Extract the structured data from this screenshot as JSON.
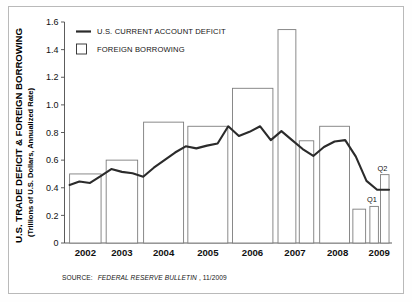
{
  "figure": {
    "border_color": "#b9b9b9",
    "background": "#ffffff"
  },
  "axis_title": {
    "main": "U.S. TRADE DEFICIT & FOREIGN BORROWING",
    "sub": "(Trillions of U.S. Dollars, Annualized Rate)"
  },
  "legend": {
    "position": "top-left-inside",
    "items": [
      {
        "label": "U.S. CURRENT ACCOUNT DEFICIT",
        "marker": "line",
        "color": "#2b2b2b"
      },
      {
        "label": "FOREIGN BORROWING",
        "marker": "open-square",
        "color": "#2b2b2b"
      }
    ]
  },
  "source": {
    "prefix": "SOURCE:",
    "publication": "FEDERAL RESERVE BULLETIN",
    "date": ", 11/2009"
  },
  "annotations": [
    {
      "text": "Q1",
      "x_value": 2008.875,
      "y_value": 0.265
    },
    {
      "text": "Q2",
      "x_value": 2009.125,
      "y_value": 0.495
    }
  ],
  "chart_data": {
    "type": "bar",
    "title": "",
    "subtitle": "",
    "xlabel": "",
    "ylabel": "U.S. TRADE DEFICIT & FOREIGN BORROWING (Trillions of U.S. Dollars, Annualized Rate)",
    "ylim": [
      0,
      1.6
    ],
    "xlim": [
      2001.6,
      2009.3
    ],
    "grid": false,
    "y_ticks": [
      0,
      0.2,
      0.4,
      0.6,
      0.8,
      1.0,
      1.2,
      1.4,
      1.6
    ],
    "y_tick_labels": [
      "0",
      "0.2",
      "0.4",
      "0.6",
      "0.8",
      "1.0",
      "1.2",
      "1.4",
      "1.6"
    ],
    "x_ticks": [
      2002,
      2003,
      2004,
      2005,
      2006,
      2007,
      2008,
      2009
    ],
    "x_tick_labels": [
      "2002",
      "2003",
      "2004",
      "2005",
      "2006",
      "2007",
      "2008",
      "2009"
    ],
    "categories": [
      "2002",
      "2003",
      "2004",
      "2005",
      "2006",
      "2007",
      "2007 H2",
      "2008",
      "2008 H2",
      "2009 Q1",
      "2009 Q2"
    ],
    "series": [
      {
        "name": "FOREIGN BORROWING",
        "type": "bar",
        "values": [
          0.5,
          0.6,
          0.875,
          0.845,
          1.12,
          1.545,
          0.74,
          0.845,
          0.245,
          0.265,
          0.495
        ],
        "bars": [
          {
            "label": "2002",
            "x_start": 2001.72,
            "x_end": 2002.46,
            "value": 0.5
          },
          {
            "label": "2003",
            "x_start": 2002.58,
            "x_end": 2003.32,
            "value": 0.6
          },
          {
            "label": "2004",
            "x_start": 2003.46,
            "x_end": 2004.4,
            "value": 0.875
          },
          {
            "label": "2005",
            "x_start": 2004.5,
            "x_end": 2005.44,
            "value": 0.845
          },
          {
            "label": "2006",
            "x_start": 2005.55,
            "x_end": 2006.5,
            "value": 1.12
          },
          {
            "label": "2007",
            "x_start": 2006.62,
            "x_end": 2007.04,
            "value": 1.545
          },
          {
            "label": "2007 H2",
            "x_start": 2007.12,
            "x_end": 2007.46,
            "value": 0.74
          },
          {
            "label": "2008",
            "x_start": 2007.6,
            "x_end": 2008.3,
            "value": 0.845
          },
          {
            "label": "2008 H2",
            "x_start": 2008.38,
            "x_end": 2008.68,
            "value": 0.245
          },
          {
            "label": "2009 Q1",
            "x_start": 2008.78,
            "x_end": 2008.98,
            "value": 0.265
          },
          {
            "label": "2009 Q2",
            "x_start": 2009.03,
            "x_end": 2009.23,
            "value": 0.495
          }
        ]
      },
      {
        "name": "U.S. CURRENT ACCOUNT DEFICIT",
        "type": "line",
        "x": [
          2001.72,
          2001.95,
          2002.2,
          2002.45,
          2002.7,
          2002.95,
          2003.2,
          2003.45,
          2003.7,
          2003.95,
          2004.2,
          2004.45,
          2004.7,
          2004.95,
          2005.2,
          2005.45,
          2005.7,
          2005.95,
          2006.2,
          2006.45,
          2006.7,
          2006.95,
          2007.2,
          2007.45,
          2007.7,
          2007.95,
          2008.2,
          2008.45,
          2008.7,
          2008.95,
          2009.23
        ],
        "values": [
          0.42,
          0.445,
          0.435,
          0.485,
          0.535,
          0.515,
          0.505,
          0.48,
          0.545,
          0.6,
          0.655,
          0.7,
          0.685,
          0.705,
          0.72,
          0.845,
          0.775,
          0.805,
          0.845,
          0.745,
          0.81,
          0.745,
          0.68,
          0.63,
          0.695,
          0.735,
          0.745,
          0.625,
          0.45,
          0.385,
          0.385
        ]
      }
    ]
  }
}
